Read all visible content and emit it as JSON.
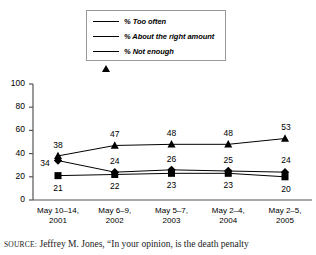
{
  "legend": {
    "items": [
      {
        "label": "% Too often",
        "marker": "square-marker-icon",
        "color": "#000000"
      },
      {
        "label": "% About the right amount",
        "marker": "diamond-marker-icon",
        "color": "#000000"
      },
      {
        "label": "% Not enough",
        "marker": "triangle-marker-icon",
        "color": "#000000"
      }
    ]
  },
  "source": {
    "prefix": "SOURCE:",
    "text": " Jeffrey M. Jones, “In your opinion, is the death penalty"
  },
  "chart_data": {
    "type": "line",
    "title": "",
    "xlabel": "",
    "ylabel": "",
    "ylim": [
      0,
      100
    ],
    "yticks": [
      "0",
      "20",
      "40",
      "60",
      "80",
      "100"
    ],
    "grid": false,
    "legend_position": "top-center",
    "categories": [
      "May 10–14,\n2001",
      "May 6–9,\n2002",
      "May 5–7,\n2003",
      "May 2–4,\n2004",
      "May 2–5,\n2005"
    ],
    "category_lines": [
      {
        "line1": "May 10–14,",
        "line2": "2001"
      },
      {
        "line1": "May 6–9,",
        "line2": "2002"
      },
      {
        "line1": "May 5–7,",
        "line2": "2003"
      },
      {
        "line1": "May 2–4,",
        "line2": "2004"
      },
      {
        "line1": "May 2–5,",
        "line2": "2005"
      }
    ],
    "series": [
      {
        "name": "% Too often",
        "marker": "square",
        "values": [
          21,
          22,
          23,
          23,
          20
        ],
        "labels": [
          "21",
          "22",
          "23",
          "23",
          "20"
        ],
        "label_position": "below"
      },
      {
        "name": "% About the right amount",
        "marker": "diamond",
        "values": [
          34,
          24,
          26,
          25,
          24
        ],
        "labels": [
          "34",
          "24",
          "26",
          "25",
          "24"
        ],
        "label_position": "mixed"
      },
      {
        "name": "% Not enough",
        "marker": "triangle",
        "values": [
          38,
          47,
          48,
          48,
          53
        ],
        "labels": [
          "38",
          "47",
          "48",
          "48",
          "53"
        ],
        "label_position": "above"
      }
    ]
  }
}
